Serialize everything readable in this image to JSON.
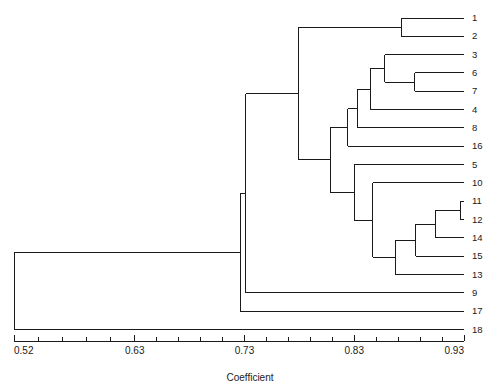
{
  "chart_data": {
    "type": "dendrogram",
    "title": "",
    "xlabel": "Coefficient",
    "ylabel": "",
    "xlim": [
      0.52,
      0.93
    ],
    "grid": false,
    "legend": null,
    "orientation": "horizontal-right-leaves",
    "tick_labels": [
      "0.52",
      "0.63",
      "0.73",
      "0.83",
      "0.93"
    ],
    "tick_values": [
      0.52,
      0.63,
      0.73,
      0.83,
      0.93
    ],
    "minor_ticks_per_interval": 5,
    "leaf_order": [
      "1",
      "2",
      "3",
      "6",
      "7",
      "4",
      "8",
      "16",
      "5",
      "10",
      "11",
      "12",
      "14",
      "15",
      "13",
      "9",
      "17",
      "18"
    ],
    "leaf_count": 18,
    "line_color": "#1a1a1a",
    "merges": [
      {
        "id": "m1",
        "label": "1 + 2",
        "coefficient": 0.873,
        "children": [
          "1",
          "2"
        ]
      },
      {
        "id": "m2",
        "label": "6 + 7",
        "coefficient": 0.885,
        "children": [
          "6",
          "7"
        ]
      },
      {
        "id": "m3",
        "label": "3 + (6,7)",
        "coefficient": 0.858,
        "children": [
          "3",
          "m2"
        ]
      },
      {
        "id": "m4",
        "label": "(3,6,7) + 4",
        "coefficient": 0.845,
        "children": [
          "m3",
          "4"
        ]
      },
      {
        "id": "m5",
        "label": "(3,6,7,4) + 8",
        "coefficient": 0.833,
        "children": [
          "m4",
          "8"
        ]
      },
      {
        "id": "m6",
        "label": "(3,6,7,4,8) + 16",
        "coefficient": 0.824,
        "children": [
          "m5",
          "16"
        ]
      },
      {
        "id": "m7",
        "label": "11 + 12",
        "coefficient": 0.927,
        "children": [
          "11",
          "12"
        ]
      },
      {
        "id": "m8",
        "label": "(11,12) + 14",
        "coefficient": 0.904,
        "children": [
          "m7",
          "14"
        ]
      },
      {
        "id": "m9",
        "label": "(11,12,14) + 15",
        "coefficient": 0.886,
        "children": [
          "m8",
          "15"
        ]
      },
      {
        "id": "m10",
        "label": "(11,12,14,15) + 13",
        "coefficient": 0.868,
        "children": [
          "m9",
          "13"
        ]
      },
      {
        "id": "m11",
        "label": "10 + (11..13)",
        "coefficient": 0.847,
        "children": [
          "10",
          "m10"
        ]
      },
      {
        "id": "m12",
        "label": "5 + (10..13)",
        "coefficient": 0.83,
        "children": [
          "5",
          "m11"
        ]
      },
      {
        "id": "m13",
        "label": "(3..16) + (5..13)",
        "coefficient": 0.808,
        "children": [
          "m6",
          "m12"
        ]
      },
      {
        "id": "m14",
        "label": "(1,2) + (3..13)",
        "coefficient": 0.779,
        "children": [
          "m1",
          "m13"
        ]
      },
      {
        "id": "m15",
        "label": "(1..13) + 9",
        "coefficient": 0.731,
        "children": [
          "m14",
          "9"
        ]
      },
      {
        "id": "m16",
        "label": "(1..9) + 17",
        "coefficient": 0.726,
        "children": [
          "m15",
          "17"
        ]
      },
      {
        "id": "m17",
        "label": "(1..17) + 18",
        "coefficient": 0.52,
        "children": [
          "m16",
          "18"
        ]
      }
    ]
  },
  "axis": {
    "title": "Coefficient",
    "ticks": [
      {
        "label": "0.52",
        "value": 0.52
      },
      {
        "label": "0.63",
        "value": 0.63
      },
      {
        "label": "0.73",
        "value": 0.73
      },
      {
        "label": "0.83",
        "value": 0.83
      },
      {
        "label": "0.93",
        "value": 0.93
      }
    ]
  },
  "caption": {
    "text": ""
  }
}
